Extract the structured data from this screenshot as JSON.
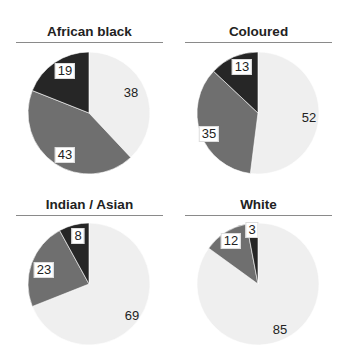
{
  "colors": {
    "light": "#efefef",
    "mid": "#6f6f6f",
    "dark": "#262626",
    "rule": "#8a8a8a"
  },
  "chart_data": [
    {
      "type": "pie",
      "title": "African black",
      "slices": [
        {
          "value": 38,
          "shade": "light"
        },
        {
          "value": 43,
          "shade": "mid"
        },
        {
          "value": 19,
          "shade": "dark"
        }
      ],
      "legend": null
    },
    {
      "type": "pie",
      "title": "Coloured",
      "slices": [
        {
          "value": 52,
          "shade": "light"
        },
        {
          "value": 35,
          "shade": "mid"
        },
        {
          "value": 13,
          "shade": "dark"
        }
      ],
      "legend": null
    },
    {
      "type": "pie",
      "title": "Indian / Asian",
      "slices": [
        {
          "value": 69,
          "shade": "light"
        },
        {
          "value": 23,
          "shade": "mid"
        },
        {
          "value": 8,
          "shade": "dark"
        }
      ],
      "legend": null
    },
    {
      "type": "pie",
      "title": "White",
      "slices": [
        {
          "value": 85,
          "shade": "light"
        },
        {
          "value": 12,
          "shade": "mid"
        },
        {
          "value": 3,
          "shade": "dark"
        }
      ],
      "legend": null
    }
  ],
  "labels": {
    "c0": [
      "38",
      "43",
      "19"
    ],
    "c1": [
      "52",
      "35",
      "13"
    ],
    "c2": [
      "69",
      "23",
      "8"
    ],
    "c3": [
      "85",
      "12",
      "3"
    ]
  }
}
